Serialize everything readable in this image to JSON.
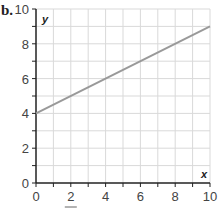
{
  "panel_label": "b.",
  "chart_data": {
    "type": "line",
    "title": "",
    "xlabel": "x",
    "ylabel": "y",
    "xlim": [
      0,
      10
    ],
    "ylim": [
      0,
      10
    ],
    "x_ticks": [
      0,
      2,
      4,
      6,
      8,
      10
    ],
    "y_ticks": [
      0,
      2,
      4,
      6,
      8,
      10
    ],
    "minor_step": 1,
    "grid": true,
    "series": [
      {
        "name": "line",
        "x": [
          0,
          10
        ],
        "y": [
          4,
          9
        ],
        "color": "#999999"
      }
    ]
  },
  "colors": {
    "grid": "#d9d9d9",
    "axis": "#222222",
    "line": "#9a9a9a",
    "text": "#444444"
  }
}
